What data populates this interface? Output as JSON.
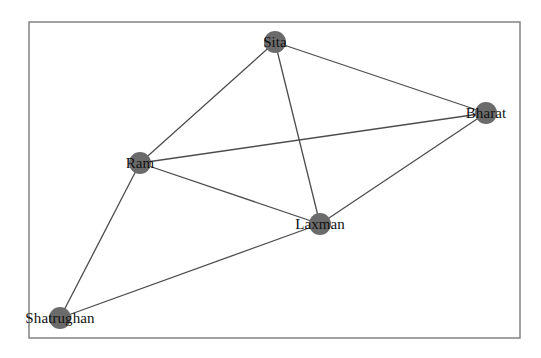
{
  "figure": {
    "background_color": "#ffffff",
    "frame": {
      "x": 29,
      "y": 22,
      "width": 491,
      "height": 316,
      "stroke_color": "#7a7a7a",
      "stroke_width": 1.4
    }
  },
  "graph": {
    "type": "node-link-diagram",
    "directed": false,
    "node_color": "#6b6b6b",
    "node_radius": 11,
    "edge_color": "#4d4d4d",
    "edge_width": 1.3,
    "label_color": "#111111",
    "label_font_size": 15,
    "nodes": [
      {
        "id": "sita",
        "label": "Sita",
        "x": 275,
        "y": 42,
        "degree": 3
      },
      {
        "id": "bharat",
        "label": "Bharat",
        "x": 486,
        "y": 113,
        "degree": 3
      },
      {
        "id": "ram",
        "label": "Ram",
        "x": 140,
        "y": 163,
        "degree": 4
      },
      {
        "id": "laxman",
        "label": "Laxman",
        "x": 320,
        "y": 224,
        "degree": 4
      },
      {
        "id": "shatrughan",
        "label": "Shatrughan",
        "x": 60,
        "y": 318,
        "degree": 2
      }
    ],
    "edges": [
      {
        "source": "ram",
        "target": "sita"
      },
      {
        "source": "sita",
        "target": "bharat"
      },
      {
        "source": "sita",
        "target": "laxman"
      },
      {
        "source": "ram",
        "target": "bharat"
      },
      {
        "source": "ram",
        "target": "laxman"
      },
      {
        "source": "ram",
        "target": "shatrughan"
      },
      {
        "source": "laxman",
        "target": "bharat"
      },
      {
        "source": "laxman",
        "target": "shatrughan"
      }
    ]
  }
}
